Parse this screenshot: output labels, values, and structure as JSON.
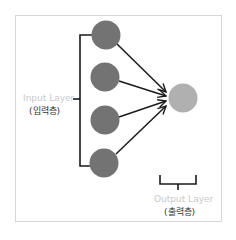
{
  "diagram": {
    "type": "single-layer-perceptron",
    "input_layer": {
      "label_en": "Input Layer",
      "label_ko": "(입력층)",
      "node_count": 4,
      "node_color": "#737373"
    },
    "output_layer": {
      "label_en": "Output Layer",
      "label_ko": "(출력층)",
      "node_count": 1,
      "node_color": "#b0b0b0"
    },
    "edges": [
      {
        "from": "input-1",
        "to": "output-1"
      },
      {
        "from": "input-2",
        "to": "output-1"
      },
      {
        "from": "input-3",
        "to": "output-1"
      },
      {
        "from": "input-4",
        "to": "output-1"
      }
    ],
    "colors": {
      "arrow": "#1a1a1a",
      "bracket": "#1a1a1a",
      "frame": "#d6d6d6",
      "english_label": "#c9c9c9",
      "korean_label": "#333333"
    }
  }
}
